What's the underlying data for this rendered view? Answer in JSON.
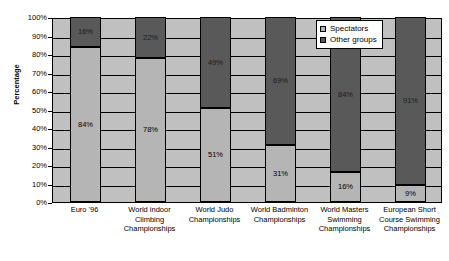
{
  "chart_data": {
    "type": "bar",
    "subtype": "stacked-100-percent",
    "title": "",
    "xlabel": "",
    "ylabel": "Percentage",
    "ylim": [
      0,
      100
    ],
    "ytick_labels": [
      "100%",
      "90%",
      "80%",
      "70%",
      "60%",
      "50%",
      "40%",
      "30%",
      "20%",
      "10%",
      "0%"
    ],
    "ytick_values": [
      100,
      90,
      80,
      70,
      60,
      50,
      40,
      30,
      20,
      10,
      0
    ],
    "grid": true,
    "legend_position": "top-right",
    "categories": [
      "Euro '96",
      "World indoor Climbing Championships",
      "World Judo Championships",
      "World Badminton Championships",
      "World Masters Swimming Championships",
      "European Short Course Swimming Championships"
    ],
    "category_lines": [
      [
        "Euro '96"
      ],
      [
        "World indoor",
        "Climbing",
        "Championships"
      ],
      [
        "World Judo",
        "Championships"
      ],
      [
        "World Badminton",
        "Championships"
      ],
      [
        "World Masters",
        "Swimming",
        "Championships"
      ],
      [
        "European Short",
        "Course Swimming",
        "Championships"
      ]
    ],
    "series": [
      {
        "name": "Spectators",
        "color": "#b5b5b5",
        "values": [
          84,
          78,
          51,
          31,
          16,
          9
        ],
        "labels": [
          "84%",
          "78%",
          "51%",
          "31%",
          "16%",
          "9%"
        ]
      },
      {
        "name": "Other groups",
        "color": "#595959",
        "values": [
          16,
          22,
          49,
          69,
          84,
          91
        ],
        "labels": [
          "16%",
          "22%",
          "49%",
          "69%",
          "84%",
          "91%"
        ]
      }
    ]
  },
  "legend": {
    "items": [
      {
        "label": "Spectators",
        "color": "#b5b5b5"
      },
      {
        "label": "Other groups",
        "color": "#595959"
      }
    ]
  },
  "colors": {
    "plot_background": "#c0c0c0",
    "page_background": "#ffffff",
    "axis": "#000000",
    "series_light": "#b5b5b5",
    "series_dark": "#595959"
  }
}
